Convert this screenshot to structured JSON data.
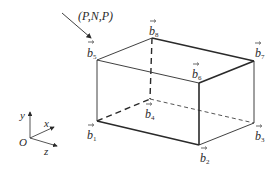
{
  "diagram": {
    "type": "cuboid-vertex-vectors",
    "direction_label": "(P,N,P)",
    "vertices": [
      {
        "id": "b1",
        "base": "b",
        "sub": "1",
        "x": 97,
        "y": 121
      },
      {
        "id": "b2",
        "base": "b",
        "sub": "2",
        "x": 199,
        "y": 145
      },
      {
        "id": "b3",
        "base": "b",
        "sub": "3",
        "x": 254,
        "y": 123
      },
      {
        "id": "b4",
        "base": "b",
        "sub": "4",
        "x": 150,
        "y": 99
      },
      {
        "id": "b5",
        "base": "b",
        "sub": "5",
        "x": 97,
        "y": 60
      },
      {
        "id": "b6",
        "base": "b",
        "sub": "6",
        "x": 199,
        "y": 83
      },
      {
        "id": "b7",
        "base": "b",
        "sub": "7",
        "x": 254,
        "y": 61
      },
      {
        "id": "b8",
        "base": "b",
        "sub": "8",
        "x": 152,
        "y": 38
      }
    ],
    "axes": {
      "origin": "O",
      "x": "x",
      "y": "y",
      "z": "z"
    },
    "colors": {
      "line": "#2a2a2a",
      "background": "#ffffff"
    }
  }
}
